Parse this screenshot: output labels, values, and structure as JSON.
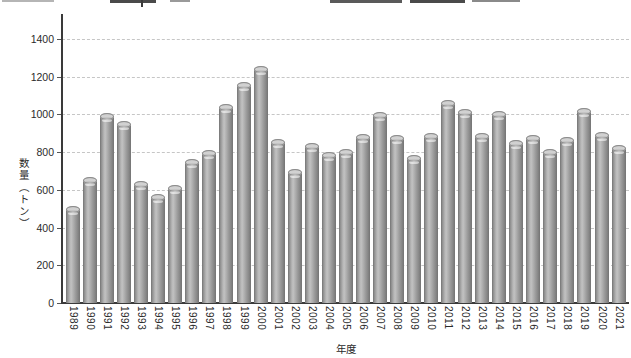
{
  "chart_data": {
    "type": "bar",
    "title": "",
    "xlabel": "年度",
    "ylabel": "数量（トン）",
    "categories": [
      "1989",
      "1990",
      "1991",
      "1992",
      "1993",
      "1994",
      "1995",
      "1996",
      "1997",
      "1998",
      "1999",
      "2000",
      "2001",
      "2002",
      "2003",
      "2004",
      "2005",
      "2006",
      "2007",
      "2008",
      "2009",
      "2010",
      "2011",
      "2012",
      "2013",
      "2014",
      "2015",
      "2016",
      "2017",
      "2018",
      "2019",
      "2020",
      "2021"
    ],
    "values": [
      500,
      650,
      990,
      950,
      630,
      560,
      610,
      750,
      795,
      1040,
      1155,
      1240,
      855,
      695,
      835,
      785,
      800,
      880,
      995,
      875,
      770,
      885,
      1060,
      1015,
      885,
      1000,
      850,
      875,
      800,
      865,
      1020,
      890,
      820
    ],
    "ylim": [
      0,
      1400
    ],
    "yticks": [
      0,
      200,
      400,
      600,
      800,
      1000,
      1200,
      1400
    ],
    "grid": "horizontal-dashed",
    "legend": "none",
    "bar_style": "3d-cylinder-gray",
    "colors": {
      "bar_mid": "#b2b2b2",
      "bar_edge": "#7d7d7d",
      "gridline": "#c6c6c6",
      "axis": "#3a3a3a",
      "text": "#2b2b2b",
      "background": "#ffffff"
    }
  }
}
